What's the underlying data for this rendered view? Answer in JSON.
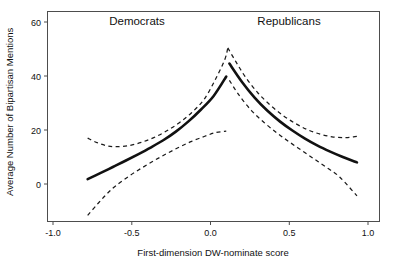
{
  "chart_data": {
    "type": "line",
    "title": "",
    "xlabel": "First-dimension DW-nominate score",
    "ylabel": "Average Number of Bipartisan Mentions",
    "xlim": [
      -1.18,
      1.18
    ],
    "ylim": [
      -14,
      64
    ],
    "xticks": [
      -1.0,
      -0.5,
      0.0,
      0.5,
      1.0
    ],
    "xtick_labels": [
      "-1.0",
      "-0.5",
      "0.0",
      "0.5",
      "1.0"
    ],
    "yticks": [
      0,
      20,
      40,
      60
    ],
    "ytick_labels": [
      "0",
      "20",
      "40",
      "60"
    ],
    "grid": false,
    "legend": "none",
    "annotations": [
      {
        "text": "Democrats",
        "x": -0.37,
        "y": 61
      },
      {
        "text": "Republicans",
        "x": 0.71,
        "y": 61
      }
    ],
    "series": [
      {
        "name": "Democrats fit",
        "style": "solid",
        "points": [
          [
            -0.78,
            1.8
          ],
          [
            -0.7,
            4.0
          ],
          [
            -0.62,
            6.3
          ],
          [
            -0.54,
            8.6
          ],
          [
            -0.46,
            11.0
          ],
          [
            -0.38,
            13.5
          ],
          [
            -0.3,
            16.2
          ],
          [
            -0.22,
            19.4
          ],
          [
            -0.14,
            23.2
          ],
          [
            -0.06,
            27.6
          ],
          [
            0.02,
            32.6
          ],
          [
            0.1,
            39.8
          ]
        ]
      },
      {
        "name": "Democrats upper CI",
        "style": "dashed",
        "points": [
          [
            -0.78,
            17.0
          ],
          [
            -0.72,
            15.3
          ],
          [
            -0.66,
            14.2
          ],
          [
            -0.6,
            13.8
          ],
          [
            -0.52,
            14.2
          ],
          [
            -0.44,
            15.4
          ],
          [
            -0.36,
            17.2
          ],
          [
            -0.28,
            19.6
          ],
          [
            -0.2,
            22.6
          ],
          [
            -0.12,
            26.4
          ],
          [
            -0.04,
            31.4
          ],
          [
            0.03,
            38.6
          ],
          [
            0.09,
            46.0
          ],
          [
            0.11,
            50.4
          ]
        ]
      },
      {
        "name": "Democrats lower CI",
        "style": "dashed",
        "points": [
          [
            -0.78,
            -11.6
          ],
          [
            -0.72,
            -7.6
          ],
          [
            -0.66,
            -3.8
          ],
          [
            -0.6,
            -0.6
          ],
          [
            -0.52,
            2.8
          ],
          [
            -0.44,
            5.8
          ],
          [
            -0.36,
            8.6
          ],
          [
            -0.28,
            11.2
          ],
          [
            -0.2,
            13.6
          ],
          [
            -0.12,
            15.8
          ],
          [
            -0.04,
            17.6
          ],
          [
            0.03,
            19.0
          ],
          [
            0.1,
            19.6
          ]
        ]
      },
      {
        "name": "Republicans fit",
        "style": "solid",
        "points": [
          [
            0.12,
            44.6
          ],
          [
            0.2,
            37.8
          ],
          [
            0.28,
            32.0
          ],
          [
            0.36,
            27.2
          ],
          [
            0.44,
            23.2
          ],
          [
            0.52,
            19.8
          ],
          [
            0.6,
            16.8
          ],
          [
            0.68,
            14.2
          ],
          [
            0.76,
            12.0
          ],
          [
            0.84,
            10.0
          ],
          [
            0.93,
            8.0
          ]
        ]
      },
      {
        "name": "Republicans upper CI",
        "style": "dashed",
        "points": [
          [
            0.11,
            50.4
          ],
          [
            0.16,
            45.4
          ],
          [
            0.22,
            39.8
          ],
          [
            0.3,
            33.8
          ],
          [
            0.38,
            29.2
          ],
          [
            0.46,
            25.4
          ],
          [
            0.54,
            22.4
          ],
          [
            0.62,
            20.0
          ],
          [
            0.7,
            18.4
          ],
          [
            0.78,
            17.4
          ],
          [
            0.86,
            17.2
          ],
          [
            0.93,
            17.6
          ]
        ]
      },
      {
        "name": "Republicans lower CI",
        "style": "dashed",
        "points": [
          [
            0.12,
            38.4
          ],
          [
            0.18,
            33.0
          ],
          [
            0.26,
            27.2
          ],
          [
            0.34,
            22.8
          ],
          [
            0.42,
            19.0
          ],
          [
            0.5,
            15.6
          ],
          [
            0.58,
            12.4
          ],
          [
            0.66,
            9.2
          ],
          [
            0.74,
            6.0
          ],
          [
            0.82,
            2.6
          ],
          [
            0.93,
            -4.4
          ]
        ]
      }
    ]
  }
}
